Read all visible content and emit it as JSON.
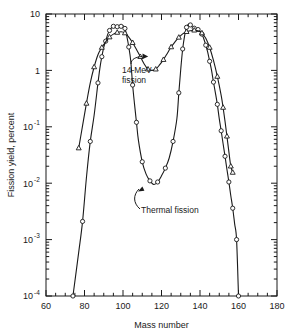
{
  "figure": {
    "background": "#ffffff",
    "ink": "#1a1a1a"
  },
  "axes": {
    "xlabel": "Mass number",
    "ylabel": "Fission yield, percent",
    "x_ticks": [
      "60",
      "80",
      "100",
      "120",
      "140",
      "160",
      "180"
    ],
    "x_tick_values": [
      60,
      80,
      100,
      120,
      140,
      160,
      180
    ],
    "x_minor_step": 5,
    "y_ticks": [
      "10",
      "1",
      "10",
      "10",
      "10",
      "10"
    ],
    "y_tick_exponents": [
      "",
      "",
      "-1",
      "-2",
      "-3",
      "-4"
    ],
    "y_tick_values": [
      10,
      1,
      0.1,
      0.01,
      0.001,
      0.0001
    ]
  },
  "annotations": {
    "a14mev_line1": "14-MeV",
    "a14mev_line2": "fission",
    "thermal": "Thermal fission"
  },
  "chart_data": {
    "type": "line",
    "title": "",
    "xlabel": "Mass number",
    "ylabel": "Fission yield, percent",
    "xlim": [
      60,
      180
    ],
    "ylim": [
      0.0001,
      10
    ],
    "yscale": "log",
    "grid": false,
    "legend": "annotated-inline",
    "series": [
      {
        "name": "Thermal fission",
        "marker": "circle",
        "points": [
          [
            74,
            0.0001
          ],
          [
            77,
            0.0006
          ],
          [
            79,
            0.0021
          ],
          [
            81,
            0.0125
          ],
          [
            83,
            0.055
          ],
          [
            85,
            0.16
          ],
          [
            87,
            0.6
          ],
          [
            88,
            1.1
          ],
          [
            89,
            1.75
          ],
          [
            90,
            2.55
          ],
          [
            91,
            3.3
          ],
          [
            92,
            4.3
          ],
          [
            93,
            5.1
          ],
          [
            94,
            5.7
          ],
          [
            95,
            6.05
          ],
          [
            96,
            6.2
          ],
          [
            97,
            5.95
          ],
          [
            98,
            5.8
          ],
          [
            99,
            6.05
          ],
          [
            100,
            6.2
          ],
          [
            101,
            5.55
          ],
          [
            102,
            4.0
          ],
          [
            103,
            2.6
          ],
          [
            104,
            1.5
          ],
          [
            105,
            0.55
          ],
          [
            106,
            0.25
          ],
          [
            107,
            0.12
          ],
          [
            108,
            0.058
          ],
          [
            110,
            0.024
          ],
          [
            112,
            0.0145
          ],
          [
            114,
            0.011
          ],
          [
            116,
            0.0095
          ],
          [
            118,
            0.0105
          ],
          [
            120,
            0.0135
          ],
          [
            122,
            0.0185
          ],
          [
            124,
            0.028
          ],
          [
            126,
            0.055
          ],
          [
            128,
            0.14
          ],
          [
            129,
            0.4
          ],
          [
            130,
            1.05
          ],
          [
            131,
            2.4
          ],
          [
            132,
            4.1
          ],
          [
            133,
            5.8
          ],
          [
            134,
            6.6
          ],
          [
            135,
            6.4
          ],
          [
            136,
            5.9
          ],
          [
            137,
            5.6
          ],
          [
            138,
            5.5
          ],
          [
            139,
            5.3
          ],
          [
            140,
            4.9
          ],
          [
            141,
            4.4
          ],
          [
            142,
            3.6
          ],
          [
            143,
            2.8
          ],
          [
            144,
            2.1
          ],
          [
            145,
            1.45
          ],
          [
            146,
            1.0
          ],
          [
            147,
            0.62
          ],
          [
            148,
            0.4
          ],
          [
            149,
            0.25
          ],
          [
            150,
            0.14
          ],
          [
            151,
            0.085
          ],
          [
            152,
            0.05
          ],
          [
            153,
            0.03
          ],
          [
            154,
            0.0175
          ],
          [
            155,
            0.0105
          ],
          [
            156,
            0.006
          ],
          [
            157,
            0.0036
          ],
          [
            158,
            0.0019
          ],
          [
            159,
            0.001
          ],
          [
            160,
            0.0001
          ]
        ]
      },
      {
        "name": "14-MeV fission",
        "marker": "triangle",
        "points": [
          [
            77,
            0.042
          ],
          [
            79,
            0.105
          ],
          [
            81,
            0.26
          ],
          [
            83,
            0.6
          ],
          [
            85,
            1.15
          ],
          [
            87,
            1.9
          ],
          [
            89,
            2.55
          ],
          [
            91,
            3.2
          ],
          [
            93,
            3.9
          ],
          [
            95,
            4.4
          ],
          [
            97,
            4.7
          ],
          [
            99,
            4.85
          ],
          [
            101,
            4.6
          ],
          [
            103,
            3.9
          ],
          [
            105,
            3.1
          ],
          [
            107,
            2.35
          ],
          [
            109,
            1.75
          ],
          [
            111,
            1.3
          ],
          [
            113,
            1.05
          ],
          [
            115,
            1.0
          ],
          [
            117,
            1.05
          ],
          [
            119,
            1.25
          ],
          [
            121,
            1.55
          ],
          [
            123,
            2.0
          ],
          [
            125,
            2.6
          ],
          [
            127,
            3.2
          ],
          [
            129,
            3.85
          ],
          [
            131,
            4.45
          ],
          [
            133,
            4.85
          ],
          [
            135,
            5.05
          ],
          [
            137,
            5.15
          ],
          [
            139,
            5.05
          ],
          [
            141,
            4.6
          ],
          [
            143,
            3.7
          ],
          [
            145,
            2.55
          ],
          [
            147,
            1.5
          ],
          [
            149,
            0.78
          ],
          [
            151,
            0.36
          ],
          [
            152,
            0.22
          ],
          [
            153,
            0.125
          ],
          [
            154,
            0.068
          ],
          [
            155,
            0.036
          ],
          [
            156,
            0.02
          ],
          [
            157,
            0.0155
          ]
        ]
      }
    ]
  }
}
